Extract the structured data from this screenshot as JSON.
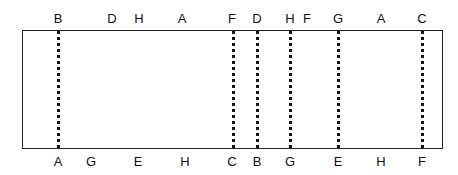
{
  "diagram": {
    "top_labels": [
      {
        "text": "B",
        "x": 58
      },
      {
        "text": "D",
        "x": 112
      },
      {
        "text": "H",
        "x": 139
      },
      {
        "text": "A",
        "x": 182
      },
      {
        "text": "F",
        "x": 232
      },
      {
        "text": "D",
        "x": 257
      },
      {
        "text": "H",
        "x": 290
      },
      {
        "text": "F",
        "x": 307
      },
      {
        "text": "G",
        "x": 338
      },
      {
        "text": "A",
        "x": 381
      },
      {
        "text": "C",
        "x": 422
      }
    ],
    "bottom_labels": [
      {
        "text": "A",
        "x": 58
      },
      {
        "text": "G",
        "x": 91
      },
      {
        "text": "E",
        "x": 138
      },
      {
        "text": "H",
        "x": 185
      },
      {
        "text": "C",
        "x": 232
      },
      {
        "text": "B",
        "x": 257
      },
      {
        "text": "G",
        "x": 290
      },
      {
        "text": "E",
        "x": 338
      },
      {
        "text": "H",
        "x": 381
      },
      {
        "text": "F",
        "x": 422
      }
    ],
    "dotted_lines_x": [
      58,
      233,
      257,
      290,
      338,
      422
    ]
  }
}
